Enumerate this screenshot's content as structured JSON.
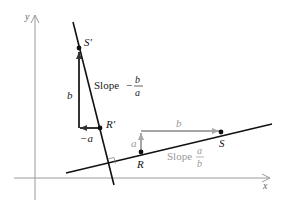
{
  "axes": {
    "x_label": "x",
    "y_label": "y"
  },
  "steep_line": {
    "slope_label": "Slope",
    "slope_sign": "−",
    "slope_num": "b",
    "slope_den": "a",
    "points": {
      "upper": "S′",
      "lower": "R′"
    },
    "vectors": {
      "vertical": "b",
      "horizontal": "−a"
    }
  },
  "shallow_line": {
    "slope_label": "Slope",
    "slope_num": "a",
    "slope_den": "b",
    "points": {
      "left": "R",
      "right": "S"
    },
    "vectors": {
      "vertical": "a",
      "horizontal": "b"
    }
  },
  "colors": {
    "axis": "#9a9a9a",
    "line": "#111111",
    "gray_vector": "#a6a6a6",
    "gray_text": "#9a9a9a"
  }
}
